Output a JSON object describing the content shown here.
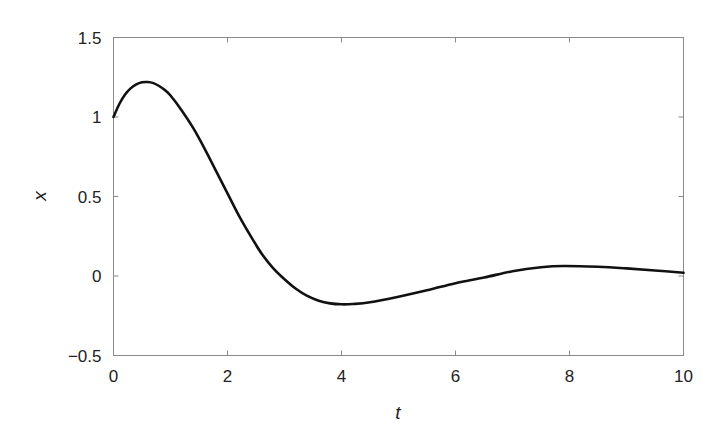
{
  "chart_data": {
    "type": "line",
    "title": "",
    "xlabel": "t",
    "ylabel": "x",
    "xlim": [
      0,
      10
    ],
    "ylim": [
      -0.5,
      1.5
    ],
    "grid": false,
    "legend": null,
    "x_ticks": [
      0,
      2,
      4,
      6,
      8,
      10
    ],
    "x_tick_labels": [
      "0",
      "2",
      "4",
      "6",
      "8",
      "10"
    ],
    "y_ticks": [
      -0.5,
      0,
      0.5,
      1,
      1.5
    ],
    "y_tick_labels": [
      "−0.5",
      "0",
      "0.5",
      "1",
      "1.5"
    ],
    "series": [
      {
        "name": "x(t)",
        "color": "#111111",
        "x": [
          0,
          0.1,
          0.2,
          0.3,
          0.4,
          0.5,
          0.6,
          0.7,
          0.8,
          0.9,
          1.0,
          1.2,
          1.4,
          1.6,
          1.8,
          2.0,
          2.2,
          2.4,
          2.6,
          2.8,
          3.0,
          3.2,
          3.4,
          3.6,
          3.8,
          4.0,
          4.2,
          4.5,
          5.0,
          5.5,
          6.0,
          6.5,
          7.0,
          7.5,
          7.9,
          8.5,
          9.0,
          9.5,
          10.0
        ],
        "values": [
          1.0,
          1.08,
          1.14,
          1.18,
          1.205,
          1.218,
          1.22,
          1.213,
          1.195,
          1.17,
          1.135,
          1.04,
          0.93,
          0.8,
          0.66,
          0.52,
          0.38,
          0.255,
          0.14,
          0.05,
          -0.02,
          -0.08,
          -0.125,
          -0.155,
          -0.172,
          -0.178,
          -0.176,
          -0.165,
          -0.13,
          -0.09,
          -0.045,
          -0.01,
          0.03,
          0.055,
          0.063,
          0.058,
          0.048,
          0.035,
          0.02
        ]
      }
    ]
  },
  "labels": {
    "xlabel": "t",
    "ylabel": "x"
  }
}
